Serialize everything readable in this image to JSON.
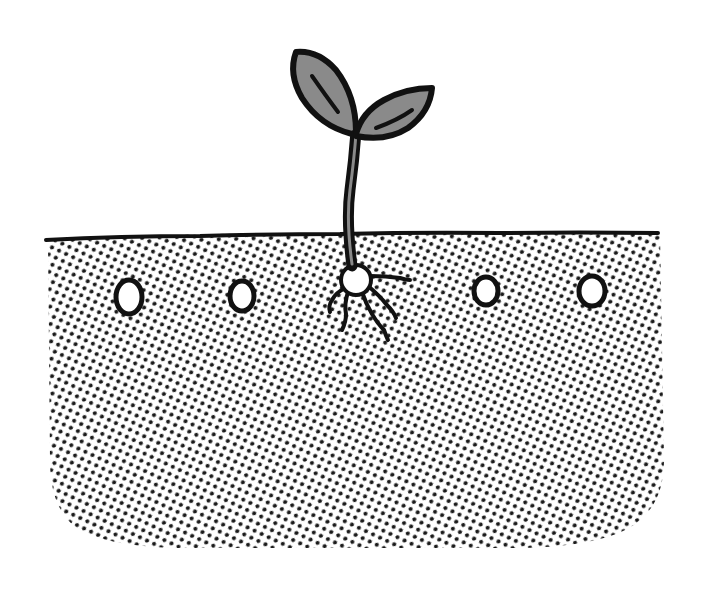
{
  "illustration": {
    "title": "Germinating seedling in soil",
    "description": "A sprout with two gray leaves emerging from soil; seed with roots under the surface; four ungerminated seeds in the soil",
    "colors": {
      "background": "#ffffff",
      "outline": "#111111",
      "leaf_fill": "#8a8a8a",
      "stem_inner": "#8a8a8a",
      "soil_dot": "#1a1a1a",
      "seed_fill": "#ffffff"
    },
    "soil": {
      "pattern": "halftone-dots",
      "surface_y": 238
    },
    "seeds": [
      {
        "name": "seed-1",
        "cx": 129,
        "cy": 297,
        "rx": 13,
        "ry": 17
      },
      {
        "name": "seed-2",
        "cx": 242,
        "cy": 296,
        "rx": 12,
        "ry": 15
      },
      {
        "name": "seed-3",
        "cx": 486,
        "cy": 291,
        "rx": 12,
        "ry": 14
      },
      {
        "name": "seed-4",
        "cx": 592,
        "cy": 291,
        "rx": 13,
        "ry": 15
      }
    ],
    "germinated_seed": {
      "cx": 356,
      "cy": 280,
      "r": 15
    }
  }
}
